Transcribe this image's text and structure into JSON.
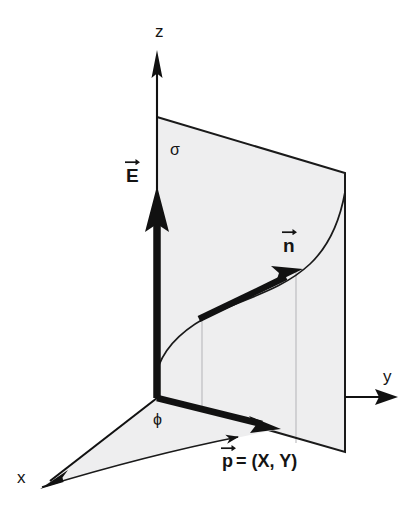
{
  "figure": {
    "type": "3d-vector-diagram",
    "background_color": "#ffffff",
    "ink_color": "#141414",
    "plane_fill_color": "#eeeeef",
    "gridline_color": "#b9b9bc"
  },
  "axes": {
    "z": {
      "label": "z",
      "direction": "up",
      "origin": [
        157,
        398
      ],
      "tip": [
        157,
        52
      ]
    },
    "y": {
      "label": "y",
      "direction": "right",
      "start": [
        345,
        397
      ],
      "tip": [
        397,
        397
      ]
    },
    "x": {
      "label": "x",
      "direction": "down-left",
      "origin": [
        157,
        398
      ],
      "tip": [
        42,
        487
      ]
    }
  },
  "surface": {
    "label": "σ",
    "name": "charged-plane",
    "corners": [
      [
        157,
        117
      ],
      [
        345,
        173
      ],
      [
        345,
        452
      ],
      [
        157,
        398
      ]
    ],
    "gridlines_x": [
      202,
      296
    ]
  },
  "ground_plane": {
    "name": "phi-angle-sector",
    "angle_label": "ϕ",
    "vertices": [
      [
        157,
        398
      ],
      [
        42,
        487
      ],
      [
        275,
        430
      ]
    ]
  },
  "vectors": {
    "E": {
      "base_label": "E",
      "accent": "vector-arrow",
      "from": [
        157,
        398
      ],
      "to": [
        157,
        190
      ],
      "description": "electric field vector along z"
    },
    "n": {
      "base_label": "n",
      "accent": "vector-arrow",
      "from": [
        198,
        320
      ],
      "to": [
        300,
        271
      ],
      "description": "unit normal vector tangent marker on surface curve"
    },
    "p": {
      "base_label": "p",
      "accent": "vector-arrow",
      "equals": "= (X, Y)",
      "full_text": "p = (X,Y)",
      "from": [
        157,
        398
      ],
      "to": [
        278,
        428
      ],
      "description": "position vector in the xy-plane"
    }
  },
  "curve": {
    "name": "field-line",
    "description": "S-shaped curve drawn on the charged plane",
    "points": [
      [
        157,
        372
      ],
      [
        172,
        345
      ],
      [
        196,
        322
      ],
      [
        250,
        300
      ],
      [
        300,
        272
      ],
      [
        330,
        232
      ],
      [
        345,
        193
      ]
    ]
  }
}
